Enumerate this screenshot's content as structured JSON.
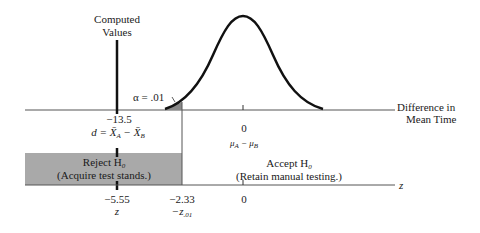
{
  "computed": {
    "line1": "Computed",
    "line2": "Values"
  },
  "alpha": {
    "label": "α = .01"
  },
  "top_axis": {
    "label_line1": "Difference in",
    "label_line2": "Mean Time",
    "d_value": "−13.5",
    "d_expr": "d = X̄",
    "d_expr_a": "A",
    "d_minus": " − X̄",
    "d_expr_b": "B",
    "zero": "0",
    "mu_expr": "μ",
    "mu_a": "A",
    "mu_minus": " − μ",
    "mu_b": "B"
  },
  "regions": {
    "reject_line1": "Reject H",
    "reject_sub": "0",
    "reject_line2": "(Acquire test stands.)",
    "accept_line1": "Accept H",
    "accept_sub": "0",
    "accept_line2": "(Retain manual testing.)"
  },
  "bottom_axis": {
    "label": "z",
    "z_value": "−5.55",
    "z_name": "z",
    "crit_value": "−2.33",
    "crit_name": "−z",
    "crit_sub": ".01",
    "zero": "0"
  },
  "colors": {
    "reject_fill": "#a9a9a9",
    "line": "#1a1a1a"
  }
}
